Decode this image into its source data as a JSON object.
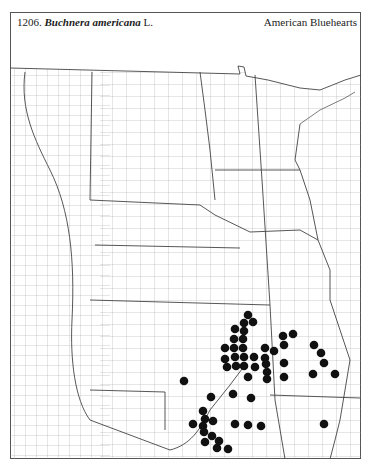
{
  "header": {
    "number": "1206.",
    "scientific_name": "Buchnera americana",
    "authority": "L.",
    "common_name": "American Bluehearts"
  },
  "map": {
    "region": "Great Plains, USA",
    "symbol": "filled-circle",
    "dot_color": "#111111",
    "line_color": "#555555",
    "dots": [
      [
        248,
        315
      ],
      [
        244,
        323
      ],
      [
        253,
        322
      ],
      [
        235,
        329
      ],
      [
        244,
        331
      ],
      [
        234,
        339
      ],
      [
        243,
        339
      ],
      [
        225,
        348
      ],
      [
        234,
        348
      ],
      [
        243,
        348
      ],
      [
        225,
        359
      ],
      [
        235,
        357
      ],
      [
        244,
        357
      ],
      [
        254,
        357
      ],
      [
        227,
        367
      ],
      [
        236,
        366
      ],
      [
        244,
        366
      ],
      [
        255,
        367
      ],
      [
        248,
        377
      ],
      [
        265,
        348
      ],
      [
        265,
        358
      ],
      [
        266,
        364
      ],
      [
        267,
        372
      ],
      [
        267,
        379
      ],
      [
        274,
        351
      ],
      [
        283,
        336
      ],
      [
        293,
        334
      ],
      [
        284,
        345
      ],
      [
        284,
        363
      ],
      [
        284,
        377
      ],
      [
        314,
        345
      ],
      [
        321,
        353
      ],
      [
        324,
        363
      ],
      [
        313,
        374
      ],
      [
        335,
        374
      ],
      [
        184,
        381
      ],
      [
        211,
        397
      ],
      [
        233,
        394
      ],
      [
        251,
        398
      ],
      [
        203,
        411
      ],
      [
        193,
        424
      ],
      [
        205,
        419
      ],
      [
        213,
        421
      ],
      [
        203,
        426
      ],
      [
        204,
        432
      ],
      [
        235,
        424
      ],
      [
        248,
        425
      ],
      [
        261,
        426
      ],
      [
        212,
        436
      ],
      [
        205,
        442
      ],
      [
        219,
        441
      ],
      [
        217,
        448
      ],
      [
        228,
        449
      ],
      [
        324,
        424
      ]
    ]
  }
}
